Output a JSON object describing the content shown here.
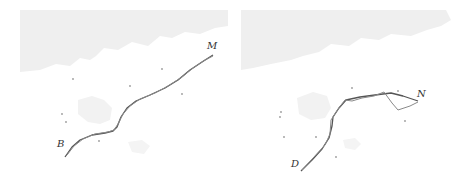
{
  "figure": {
    "panels": [
      {
        "id": "left",
        "start_label": "B",
        "end_label": "M",
        "paths": [
          {
            "name": "path-a",
            "points": [
              [
                65,
                157
              ],
              [
                72,
                147
              ],
              [
                80,
                140
              ],
              [
                92,
                135
              ],
              [
                105,
                133
              ],
              [
                113,
                131
              ],
              [
                117,
                127
              ],
              [
                121,
                117
              ],
              [
                127,
                108
              ],
              [
                136,
                101
              ],
              [
                150,
                95
              ],
              [
                165,
                88
              ],
              [
                178,
                80
              ],
              [
                190,
                70
              ],
              [
                202,
                62
              ],
              [
                213,
                55
              ]
            ]
          },
          {
            "name": "path-b",
            "points": [
              [
                67,
                155
              ],
              [
                74,
                146
              ],
              [
                83,
                139
              ],
              [
                95,
                134
              ],
              [
                108,
                132
              ],
              [
                114,
                130
              ],
              [
                118,
                124
              ],
              [
                123,
                114
              ],
              [
                130,
                106
              ],
              [
                140,
                99
              ],
              [
                155,
                93
              ],
              [
                168,
                86
              ],
              [
                182,
                77
              ],
              [
                193,
                68
              ],
              [
                205,
                60
              ],
              [
                213,
                56
              ]
            ]
          }
        ],
        "dots": [
          [
            73,
            79
          ],
          [
            130,
            86
          ],
          [
            162,
            69
          ],
          [
            182,
            94
          ],
          [
            62,
            114
          ],
          [
            66,
            122
          ],
          [
            99,
            141
          ]
        ],
        "label_positions": {
          "start": [
            57,
            139
          ],
          "end": [
            207,
            41
          ]
        }
      },
      {
        "id": "right",
        "start_label": "D",
        "end_label": "N",
        "paths": [
          {
            "name": "path-a",
            "points": [
              [
                301,
                171
              ],
              [
                312,
                160
              ],
              [
                322,
                149
              ],
              [
                329,
                138
              ],
              [
                332,
                126
              ],
              [
                333,
                117
              ],
              [
                339,
                108
              ],
              [
                346,
                100
              ],
              [
                360,
                97
              ],
              [
                375,
                95
              ],
              [
                391,
                93
              ],
              [
                403,
                96
              ],
              [
                418,
                101
              ]
            ]
          },
          {
            "name": "path-b",
            "points": [
              [
                302,
                170
              ],
              [
                314,
                157
              ],
              [
                325,
                145
              ],
              [
                330,
                134
              ],
              [
                331,
                120
              ],
              [
                338,
                109
              ],
              [
                345,
                100
              ],
              [
                352,
                101
              ],
              [
                362,
                98
              ],
              [
                374,
                96
              ],
              [
                384,
                92
              ],
              [
                392,
                103
              ],
              [
                398,
                110
              ],
              [
                410,
                106
              ],
              [
                418,
                102
              ]
            ]
          }
        ],
        "dots": [
          [
            281,
            112
          ],
          [
            280,
            117
          ],
          [
            284,
            137
          ],
          [
            316,
            137
          ],
          [
            336,
            157
          ],
          [
            352,
            88
          ],
          [
            398,
            91
          ],
          [
            405,
            121
          ]
        ],
        "label_positions": {
          "start": [
            291,
            159
          ],
          "end": [
            417,
            89
          ]
        }
      }
    ],
    "colors": {
      "path": "#555555",
      "path_light": "#8a8a8a",
      "dot": "#9a9a9a",
      "map_fill": "#ededed",
      "map_fill_light": "#f3f3f3",
      "label": "#333333"
    }
  }
}
